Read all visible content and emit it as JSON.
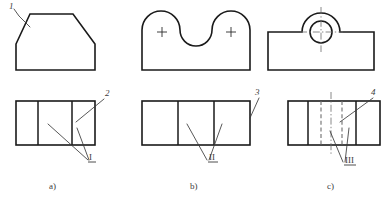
{
  "figure": {
    "background_color": "#ffffff",
    "line_color": "#1a1a1a",
    "hidden_line_color": "#6e6e6e",
    "center_line_color": "#6b6b6b",
    "label_color": "#3b3b3b"
  },
  "groups": [
    {
      "key": "a",
      "caption": "a)",
      "top_view_name": "chamfered-block-front-view",
      "bottom_view_name": "three-panel-top-view",
      "labels": {
        "surface_top": "1",
        "surface_right": "2",
        "region_roman": "I"
      }
    },
    {
      "key": "b",
      "caption": "b)",
      "top_view_name": "twin-lobe-front-view",
      "bottom_view_name": "three-panel-top-view",
      "labels": {
        "surface_right": "3",
        "region_roman": "II"
      },
      "center_marks": [
        "+",
        "+"
      ]
    },
    {
      "key": "c",
      "caption": "c)",
      "top_view_name": "boss-with-hole-front-view",
      "bottom_view_name": "four-panel-top-view-hidden",
      "labels": {
        "surface_right": "4",
        "region_roman": "III"
      }
    }
  ],
  "label_list": [
    "1",
    "2",
    "3",
    "4",
    "I",
    "II",
    "III"
  ],
  "captions": [
    "a)",
    "b)",
    "c)"
  ]
}
